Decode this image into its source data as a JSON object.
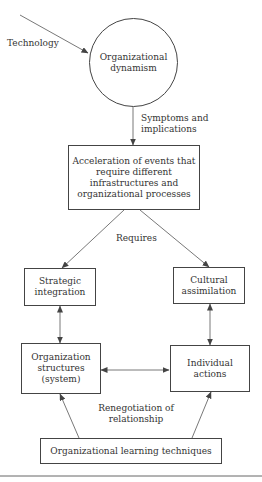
{
  "diagram": {
    "nodes": {
      "org_dynamism": {
        "label": "Organizational\ndynamism",
        "shape": "circle"
      },
      "acceleration": {
        "label": "Acceleration of events that\nrequire different\ninfrastructures and\norganizational processes",
        "shape": "box"
      },
      "strategic": {
        "label": "Strategic\nintegration",
        "shape": "box"
      },
      "cultural": {
        "label": "Cultural\nassimilation",
        "shape": "box"
      },
      "org_structures": {
        "label": "Organization\nstructures\n(system)",
        "shape": "box"
      },
      "individual": {
        "label": "Individual\nactions",
        "shape": "box"
      },
      "learning": {
        "label": "Organizational learning techniques",
        "shape": "box"
      }
    },
    "edge_labels": {
      "technology": "Technology",
      "symptoms": "Symptoms and\nimplications",
      "requires": "Requires",
      "renegotiation": "Renegotiation of\nrelationship"
    },
    "edges": [
      {
        "from": "Technology",
        "to": "org_dynamism",
        "type": "arrow"
      },
      {
        "from": "org_dynamism",
        "to": "acceleration",
        "type": "arrow",
        "label": "Symptoms and implications"
      },
      {
        "from": "acceleration",
        "to": "strategic",
        "type": "arrow",
        "label": "Requires"
      },
      {
        "from": "acceleration",
        "to": "cultural",
        "type": "arrow",
        "label": "Requires"
      },
      {
        "from": "strategic",
        "to": "org_structures",
        "type": "bidirectional"
      },
      {
        "from": "cultural",
        "to": "individual",
        "type": "bidirectional"
      },
      {
        "from": "org_structures",
        "to": "individual",
        "type": "bidirectional",
        "label": "Renegotiation of relationship"
      },
      {
        "from": "learning",
        "to": "org_structures",
        "type": "arrow"
      },
      {
        "from": "learning",
        "to": "individual",
        "type": "arrow"
      }
    ],
    "colors": {
      "stroke": "#444444",
      "text": "#333333",
      "background": "#ffffff"
    }
  }
}
